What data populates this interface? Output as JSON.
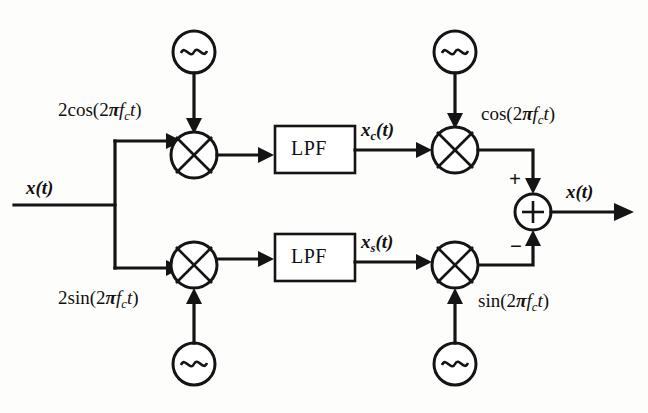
{
  "diagram": {
    "type": "signal-flow-block-diagram",
    "background_color": "#fdfdfc",
    "line_color": "#141414",
    "input": {
      "label_html": "<span class=\"bit\">x</span><span class=\"bit\">(</span><span class=\"bit\">t</span><span class=\"bit\">)</span>",
      "label_text": "x(t)"
    },
    "output": {
      "label_text": "x(t)"
    },
    "branches": {
      "upper": {
        "local_oscillator_label": "2cos(2πfct)",
        "filter_label": "LPF",
        "filter_output_label": "xc(t)",
        "remod_carrier_label": "cos(2πfct)",
        "summer_sign": "+"
      },
      "lower": {
        "local_oscillator_label": "2sin(2πfct)",
        "filter_label": "LPF",
        "filter_output_label": "xs(t)",
        "remod_carrier_label": "sin(2πfct)",
        "summer_sign": "−"
      }
    },
    "summer": {
      "symbol": "+",
      "plus_input": "+",
      "minus_input": "−"
    },
    "oscillator_symbol": "~",
    "mixer_symbol": "⊗",
    "element_counts": {
      "oscillators": 4,
      "mixers": 4,
      "filters": 2,
      "summers": 1
    }
  }
}
